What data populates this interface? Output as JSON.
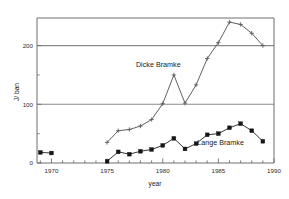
{
  "chart_data": {
    "type": "line",
    "title": "",
    "xlabel": "year",
    "ylabel": "J/ ban",
    "xlim": [
      1968.7,
      1990.0
    ],
    "ylim": [
      0,
      247
    ],
    "grid": true,
    "gridlines_y": [
      100,
      200
    ],
    "legend_position": "inline-annotation",
    "xticks": [
      1970,
      1975,
      1980,
      1985,
      1990
    ],
    "xticklabels": [
      "1970",
      "1975",
      "1980",
      "1985",
      "1990"
    ],
    "xtick_minor_step": 1,
    "yticks": [
      0,
      100,
      200
    ],
    "yticklabels": [
      "0",
      "100",
      "200"
    ],
    "ytick_minor": [
      50,
      150
    ],
    "series": [
      {
        "name": "Dicke Bramke",
        "marker": "cross",
        "x": [
          1975,
          1976,
          1977,
          1978,
          1979,
          1980,
          1981,
          1982,
          1983,
          1984,
          1985,
          1986,
          1987,
          1988,
          1989
        ],
        "values": [
          35,
          55,
          57,
          63,
          74,
          101,
          150,
          102,
          133,
          178,
          205,
          240,
          236,
          221,
          200
        ]
      },
      {
        "name": "Lange Bramke",
        "marker": "square",
        "segments": [
          {
            "x": [
              1969,
              1970
            ],
            "values": [
              18,
              17
            ]
          },
          {
            "x": [
              1975,
              1976,
              1977,
              1978,
              1979,
              1980,
              1981,
              1982,
              1983,
              1984,
              1985,
              1986,
              1987,
              1988,
              1989
            ],
            "values": [
              3,
              19,
              15,
              20,
              23,
              30,
              42,
              24,
              33,
              48,
              50,
              60,
              67,
              55,
              37
            ]
          }
        ]
      }
    ],
    "annotations": [
      {
        "text": "Dicke Bramke",
        "x": 1979.6,
        "y": 163
      },
      {
        "text": "Lange Bramke",
        "x": 1985.2,
        "y": 30
      }
    ]
  },
  "axis": {
    "x_title": "year",
    "y_title": "J/ ban"
  },
  "labels": {
    "dicke": "Dicke Bramke",
    "lange": "Lange Bramke"
  },
  "colors": {
    "dicke_line": "#58585c",
    "lange_line": "#2a2a2a",
    "grid": "#8a8a8a",
    "axis": "#6e6e6e",
    "text": "#1d1d1d",
    "background": "#ffffff"
  }
}
